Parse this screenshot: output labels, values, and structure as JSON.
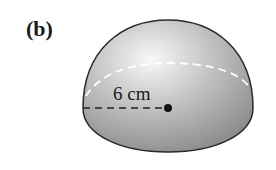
{
  "figure": {
    "label": "(b)",
    "shape": "hemisphere",
    "radius_label": "6 cm",
    "colors": {
      "outline": "#2a2a2a",
      "fill_light": "#f2f2f2",
      "fill_dark": "#8c8c8c",
      "hidden_edge": "#ffffff",
      "radius_line": "#222222"
    }
  }
}
